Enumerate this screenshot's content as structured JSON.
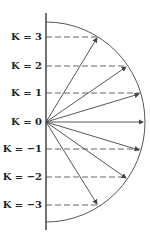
{
  "diagram": {
    "labels": [
      {
        "text": "K = 3",
        "k": 3
      },
      {
        "text": "K = 2",
        "k": 2
      },
      {
        "text": "K = 1",
        "k": 1
      },
      {
        "text": "K = 0",
        "k": 0
      },
      {
        "text": "K = −1",
        "k": -1
      },
      {
        "text": "K = −2",
        "k": -2
      },
      {
        "text": "K = −3",
        "k": -3
      }
    ],
    "colors": {
      "line": "#444444",
      "dash": "#555555",
      "text": "#222222"
    }
  }
}
